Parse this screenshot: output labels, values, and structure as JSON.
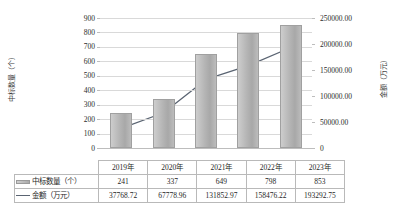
{
  "chart_data": {
    "type": "bar",
    "title": "",
    "xlabel": "",
    "categories": [
      "2019年",
      "2020年",
      "2021年",
      "2022年",
      "2023年"
    ],
    "grid": true,
    "legend_position": "table-below",
    "axes": {
      "left": {
        "label": "中标数量（个）",
        "ylim": [
          0,
          900
        ],
        "ticks": [
          "900",
          "800",
          "700",
          "600",
          "500",
          "400",
          "300",
          "200",
          "100",
          "0"
        ],
        "tick_values": [
          900,
          800,
          700,
          600,
          500,
          400,
          300,
          200,
          100,
          0
        ]
      },
      "right": {
        "label": "金额（万元）",
        "ylim": [
          0,
          250000
        ],
        "ticks": [
          "250000.00",
          "200000.00",
          "150000.00",
          "100000.00",
          "50000.00",
          "0"
        ],
        "tick_values": [
          250000,
          200000,
          150000,
          100000,
          50000,
          0
        ]
      }
    },
    "series": [
      {
        "name": "中标数量（个）",
        "type": "bar",
        "axis": "left",
        "color": "#b4b4b4",
        "values": [
          241,
          337,
          649,
          798,
          853
        ]
      },
      {
        "name": "金额（万元）",
        "type": "line",
        "axis": "right",
        "color": "#5a6472",
        "values": [
          37768.72,
          67778.96,
          131852.97,
          158476.22,
          193292.75
        ],
        "value_labels": [
          "37768.72",
          "67778.96",
          "131852.97",
          "158476.22",
          "193292.75"
        ]
      }
    ]
  },
  "data_table": {
    "corner": "",
    "columns": [
      "2019年",
      "2020年",
      "2021年",
      "2022年",
      "2023年"
    ],
    "rows": [
      {
        "label": "中标数量（个）",
        "swatch": "bar-swatch",
        "values": [
          "241",
          "337",
          "649",
          "798",
          "853"
        ]
      },
      {
        "label": "金额（万元）",
        "swatch": "line-swatch",
        "values": [
          "37768.72",
          "67778.96",
          "131852.97",
          "158476.22",
          "193292.75"
        ]
      }
    ]
  }
}
